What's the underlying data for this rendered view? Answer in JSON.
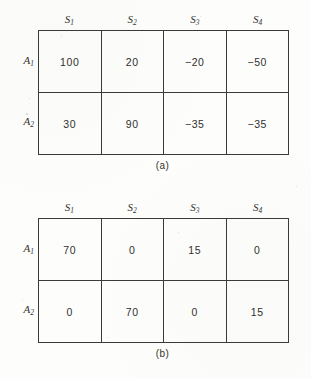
{
  "figures": [
    {
      "id": "a",
      "caption": "(a)",
      "column_headers": [
        {
          "base": "S",
          "sub": "1"
        },
        {
          "base": "S",
          "sub": "2"
        },
        {
          "base": "S",
          "sub": "3"
        },
        {
          "base": "S",
          "sub": "4"
        }
      ],
      "row_labels": [
        {
          "base": "A",
          "sub": "1"
        },
        {
          "base": "A",
          "sub": "2"
        }
      ],
      "rows": [
        [
          "100",
          "20",
          "−20",
          "−50"
        ],
        [
          "30",
          "90",
          "−35",
          "−35"
        ]
      ]
    },
    {
      "id": "b",
      "caption": "(b)",
      "column_headers": [
        {
          "base": "S",
          "sub": "1"
        },
        {
          "base": "S",
          "sub": "2"
        },
        {
          "base": "S",
          "sub": "3"
        },
        {
          "base": "S",
          "sub": "4"
        }
      ],
      "row_labels": [
        {
          "base": "A",
          "sub": "1"
        },
        {
          "base": "A",
          "sub": "2"
        }
      ],
      "rows": [
        [
          "70",
          "0",
          "15",
          "0"
        ],
        [
          "0",
          "70",
          "0",
          "15"
        ]
      ]
    }
  ],
  "colors": {
    "page_background": "#fdfdfc",
    "rule": "#3a3a38",
    "text": "#30302d"
  }
}
